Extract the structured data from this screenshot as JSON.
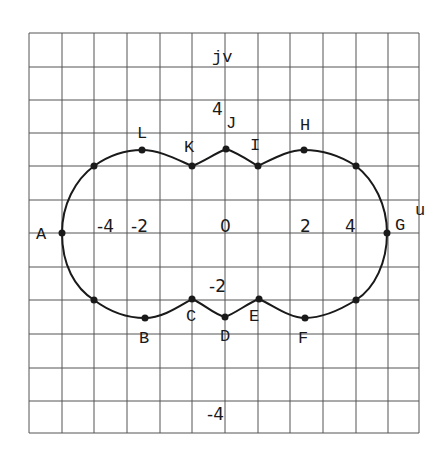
{
  "diagram": {
    "axes": {
      "horizontal_label": "u",
      "vertical_label": "jv",
      "u_ticks": [
        "-4",
        "-2",
        "0",
        "2",
        "4"
      ],
      "v_ticks": [
        "4",
        "-2",
        "-4"
      ]
    },
    "grid": {
      "columns": 12,
      "rows": 12,
      "visible": true
    },
    "points": [
      {
        "label": "A",
        "px": [
          62,
          233
        ]
      },
      {
        "label": "B",
        "px": [
          145,
          318
        ]
      },
      {
        "label": "C",
        "px": [
          192,
          299
        ]
      },
      {
        "label": "D",
        "px": [
          225,
          317
        ]
      },
      {
        "label": "E",
        "px": [
          259,
          299
        ]
      },
      {
        "label": "F",
        "px": [
          305,
          318
        ]
      },
      {
        "label": "G",
        "px": [
          387,
          233
        ]
      },
      {
        "label": "H",
        "px": [
          304,
          150
        ]
      },
      {
        "label": "I",
        "px": [
          258,
          166
        ]
      },
      {
        "label": "J",
        "px": [
          226,
          149
        ]
      },
      {
        "label": "K",
        "px": [
          192,
          166
        ]
      },
      {
        "label": "L",
        "px": [
          142,
          150
        ]
      }
    ],
    "unlabeled_points": [
      [
        94,
        300
      ],
      [
        356,
        300
      ],
      [
        356,
        166
      ],
      [
        94,
        166
      ]
    ],
    "colors": {
      "grid": "#555555",
      "curve": "#1a1a1a",
      "background": "#ffffff"
    }
  }
}
